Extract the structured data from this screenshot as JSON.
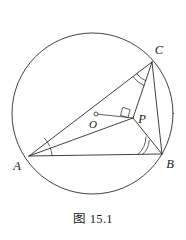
{
  "figure": {
    "caption_prefix": "图",
    "caption_number": "15.1",
    "caption_full": "图 15.1",
    "type": "euclidean-geometry-diagram"
  },
  "labels": {
    "A": "A",
    "B": "B",
    "C": "C",
    "O": "O",
    "P": "P"
  },
  "colors": {
    "stroke": "#2b2b2b",
    "background": "#ffffff",
    "text": "#1a1a1a"
  },
  "geometry": {
    "circle": {
      "cx": 92.5,
      "cy": 113.5,
      "r": 80.5
    },
    "points": {
      "A": {
        "x": 29,
        "y": 156,
        "label_x": 17,
        "label_y": 170
      },
      "B": {
        "x": 162,
        "y": 154,
        "label_x": 169,
        "label_y": 168
      },
      "C": {
        "x": 152,
        "y": 62,
        "label_x": 158,
        "label_y": 54
      },
      "O": {
        "x": 96,
        "y": 114,
        "label_x": 92,
        "label_y": 128
      },
      "P": {
        "x": 133,
        "y": 118,
        "label_x": 139,
        "label_y": 122
      }
    },
    "segments": [
      {
        "name": "AB",
        "from": "A",
        "to": "B"
      },
      {
        "name": "AC",
        "from": "A",
        "to": "C"
      },
      {
        "name": "CB",
        "from": "C",
        "to": "B"
      },
      {
        "name": "AP-extended",
        "from": "A",
        "to": "P"
      },
      {
        "name": "CP",
        "from": "C",
        "to": "P"
      },
      {
        "name": "PB",
        "from": "P",
        "to": "B"
      },
      {
        "name": "OP",
        "from": "O",
        "to": "P"
      }
    ],
    "angle_marks": [
      {
        "name": "angle-at-A",
        "vertex": "A",
        "arcs": 1
      },
      {
        "name": "angle-at-C",
        "vertex": "C",
        "arcs": 2
      },
      {
        "name": "angle-at-B",
        "vertex": "B",
        "arcs": 2
      },
      {
        "name": "right-angle-at-P",
        "vertex": "P",
        "type": "square"
      }
    ]
  }
}
